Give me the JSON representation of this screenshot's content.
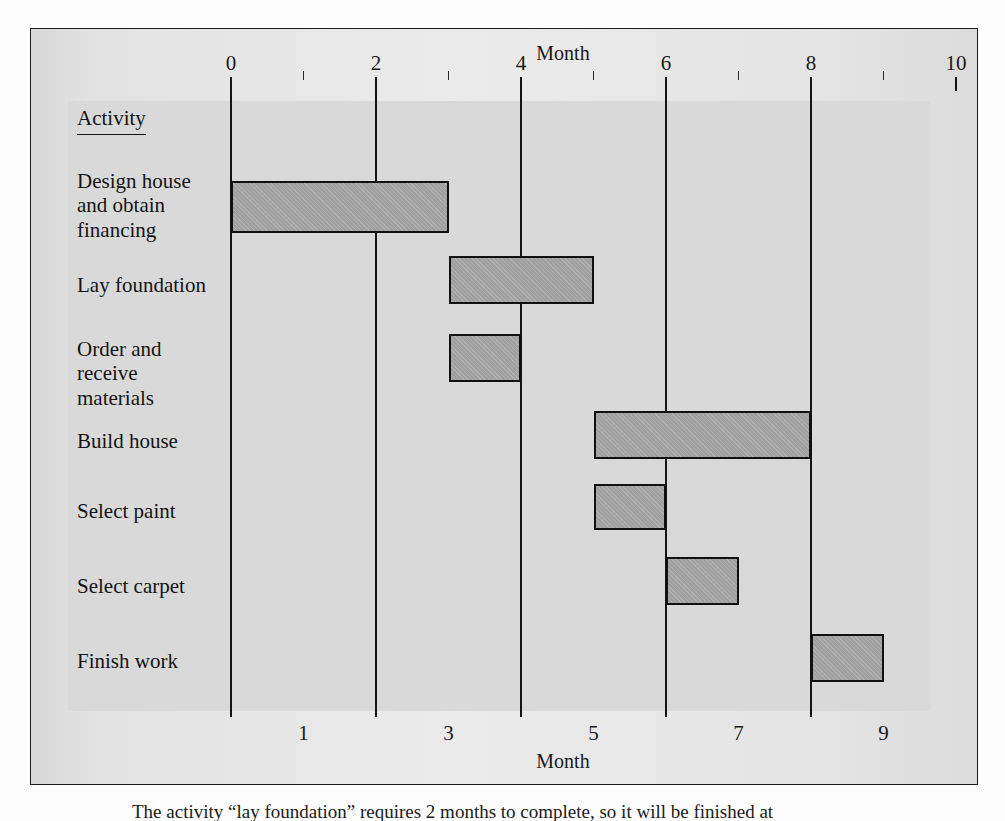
{
  "figure": {
    "activity_header": "Activity",
    "top_axis_title": "Month",
    "bottom_axis_title": "Month",
    "caption": "The activity “lay foundation” requires 2 months to complete, so it will be finished at"
  },
  "colors": {
    "bar_fill": "#a5a5a5",
    "bar_border": "#101010",
    "panel_bg": "#d9d9d9",
    "frame_bg": "#e2e2e2",
    "frame_border": "#1d1d1d",
    "gridline": "#141414",
    "text": "#141414"
  },
  "chart_data": {
    "type": "bar",
    "subtype": "gantt",
    "title": "",
    "xlabel": "Month",
    "ylabel": "Activity",
    "xlim": [
      0,
      10
    ],
    "grid": true,
    "legend": "none",
    "top_axis_ticks": [
      "0",
      "2",
      "4",
      "6",
      "8",
      "10"
    ],
    "top_axis_tick_values": [
      0,
      2,
      4,
      6,
      8,
      10
    ],
    "top_axis_minor_tick_values": [
      1,
      3,
      5,
      7,
      9
    ],
    "bottom_axis_ticks": [
      "1",
      "3",
      "5",
      "7",
      "9"
    ],
    "bottom_axis_tick_values": [
      1,
      3,
      5,
      7,
      9
    ],
    "gridline_values": [
      0,
      2,
      4,
      6,
      8
    ],
    "categories": [
      "Design house\nand obtain\nfinancing",
      "Lay foundation",
      "Order and\nreceive\nmaterials",
      "Build house",
      "Select paint",
      "Select carpet",
      "Finish work"
    ],
    "tasks": [
      {
        "label": "Design house\nand obtain\nfinancing",
        "start": 0,
        "end": 3,
        "duration": 3
      },
      {
        "label": "Lay foundation",
        "start": 3,
        "end": 5,
        "duration": 2
      },
      {
        "label": "Order and\nreceive\nmaterials",
        "start": 3,
        "end": 4,
        "duration": 1
      },
      {
        "label": "Build house",
        "start": 5,
        "end": 8,
        "duration": 3
      },
      {
        "label": "Select paint",
        "start": 5,
        "end": 6,
        "duration": 1
      },
      {
        "label": "Select carpet",
        "start": 6,
        "end": 7,
        "duration": 1
      },
      {
        "label": "Finish work",
        "start": 8,
        "end": 9,
        "duration": 1
      }
    ]
  },
  "layout": {
    "month0_x": 200,
    "px_per_month": 72.5,
    "grid_top": 62,
    "grid_bottom": 688,
    "row_tops": [
      148,
      230,
      305,
      377,
      455,
      528,
      605
    ],
    "bar_tops": [
      152,
      227,
      305,
      382,
      455,
      528,
      605
    ],
    "bar_heights": [
      52,
      48,
      48,
      48,
      46,
      48,
      48
    ],
    "label_tops": [
      140,
      244,
      308,
      400,
      470,
      545,
      620
    ]
  }
}
